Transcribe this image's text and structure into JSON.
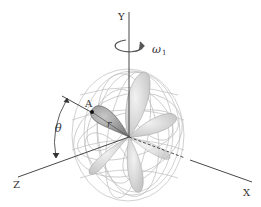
{
  "diagram": {
    "axes": {
      "y_label": "Y",
      "z_label": "Z",
      "x_label": "X"
    },
    "rotation_label": "ω",
    "rotation_subscript": "1",
    "point_label": "A",
    "radius_label": "r",
    "angle_label": "θ",
    "colors": {
      "axis": "#333333",
      "wireframe": "#b8b8b8",
      "lobe_dark": "#8a8a8a",
      "lobe_light": "#d9d9d9",
      "background": "#ffffff"
    }
  }
}
